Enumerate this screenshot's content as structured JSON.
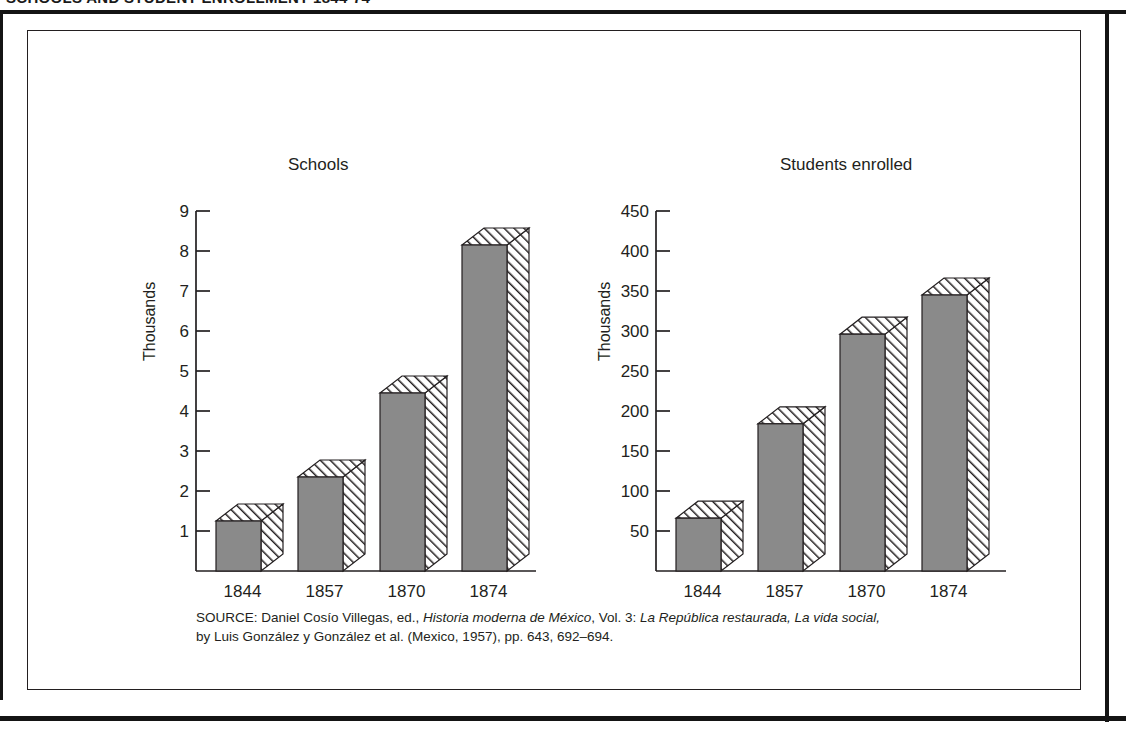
{
  "headline": "SCHOOLS AND STUDENT ENROLLMENT 1844-74",
  "figure": {
    "source_prefix": "SOURCE:",
    "source_line1_a": " Daniel Cosío Villegas, ed., ",
    "source_line1_italic1": "Historia moderna de México",
    "source_line1_b": ", Vol. 3: ",
    "source_line1_italic2": "La República restaurada, La vida social,",
    "source_line2": "by Luis González y González et al. (Mexico, 1957), pp. 643, 692–694."
  },
  "colors": {
    "bar_fill": "#8a8a8a",
    "ink": "#231f20",
    "paper": "#ffffff"
  },
  "chart_data": [
    {
      "id": "schools",
      "type": "bar",
      "title": "Schools",
      "xlabel": "",
      "ylabel": "Thousands",
      "categories": [
        "1844",
        "1857",
        "1870",
        "1874"
      ],
      "values": [
        1.25,
        2.35,
        4.45,
        8.15
      ],
      "yticks": [
        1,
        2,
        3,
        4,
        5,
        6,
        7,
        8,
        9
      ],
      "ytick_labels": [
        "1",
        "2",
        "3",
        "4",
        "5",
        "6",
        "7",
        "8",
        "9"
      ],
      "ylim": [
        0,
        9
      ],
      "grid": false,
      "legend": null,
      "style": "3d-extruded-hatched"
    },
    {
      "id": "students_enrolled",
      "type": "bar",
      "title": "Students enrolled",
      "xlabel": "",
      "ylabel": "Thousands",
      "categories": [
        "1844",
        "1857",
        "1870",
        "1874"
      ],
      "values": [
        66,
        184,
        296,
        345
      ],
      "yticks": [
        50,
        100,
        150,
        200,
        250,
        300,
        350,
        400,
        450
      ],
      "ytick_labels": [
        "50",
        "100",
        "150",
        "200",
        "250",
        "300",
        "350",
        "400",
        "450"
      ],
      "ylim": [
        0,
        450
      ],
      "grid": false,
      "legend": null,
      "style": "3d-extruded-hatched"
    }
  ]
}
